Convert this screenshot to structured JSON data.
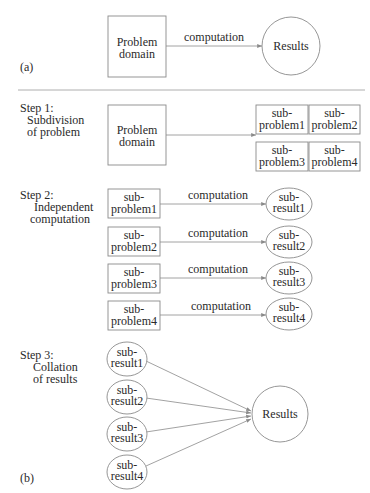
{
  "figure": {
    "part_a": {
      "label": "(a)",
      "source": {
        "lines": [
          "Problem",
          "domain"
        ]
      },
      "edge_label": "computation",
      "target": {
        "label": "Results"
      }
    },
    "part_b": {
      "label": "(b)",
      "step1": {
        "title_lines": [
          "Step 1:",
          "Subdivision",
          "of problem"
        ],
        "source": {
          "lines": [
            "Problem",
            "domain"
          ]
        },
        "subproblems": [
          {
            "lines": [
              "sub-",
              "problem1"
            ]
          },
          {
            "lines": [
              "sub-",
              "problem2"
            ]
          },
          {
            "lines": [
              "sub-",
              "problem3"
            ]
          },
          {
            "lines": [
              "sub-",
              "problem4"
            ]
          }
        ]
      },
      "step2": {
        "title_lines": [
          "Step 2:",
          "Independent",
          "computation"
        ],
        "rows": [
          {
            "source": [
              "sub-",
              "problem1"
            ],
            "edge_label": "computation",
            "target": [
              "sub-",
              "result1"
            ]
          },
          {
            "source": [
              "sub-",
              "problem2"
            ],
            "edge_label": "computation",
            "target": [
              "sub-",
              "result2"
            ]
          },
          {
            "source": [
              "sub-",
              "problem3"
            ],
            "edge_label": "computation",
            "target": [
              "sub-",
              "result3"
            ]
          },
          {
            "source": [
              "sub-",
              "problem4"
            ],
            "edge_label": "computation",
            "target": [
              "sub-",
              "result4"
            ]
          }
        ]
      },
      "step3": {
        "title_lines": [
          "Step 3:",
          "Collation",
          "of results"
        ],
        "subresults": [
          {
            "lines": [
              "sub-",
              "result1"
            ]
          },
          {
            "lines": [
              "sub-",
              "result2"
            ]
          },
          {
            "lines": [
              "sub-",
              "result3"
            ]
          },
          {
            "lines": [
              "sub-",
              "result4"
            ]
          }
        ],
        "target": {
          "label": "Results"
        }
      }
    }
  }
}
